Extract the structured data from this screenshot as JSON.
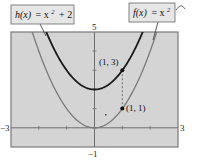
{
  "chart_data": {
    "type": "line",
    "title": "",
    "xlabel": "",
    "ylabel": "",
    "xlim": [
      -3,
      3
    ],
    "ylim": [
      -1,
      5
    ],
    "grid": false,
    "tick_labels": {
      "x_min": "−3",
      "x_max": "3",
      "y_min": "−1",
      "y_max": "5"
    },
    "series": [
      {
        "name": "h(x) = x² + 2",
        "function": "x^2 + 2",
        "color": "#1a1a1a",
        "x": [
          -1.732,
          -1.5,
          -1,
          -0.5,
          0,
          0.5,
          1,
          1.5,
          1.732
        ],
        "values": [
          5,
          4.25,
          3,
          2.25,
          2,
          2.25,
          3,
          4.25,
          5
        ]
      },
      {
        "name": "f(x) = x²",
        "function": "x^2",
        "color": "#7a7a7a",
        "x": [
          -2.236,
          -2,
          -1.5,
          -1,
          -0.5,
          0,
          0.5,
          1,
          1.5,
          2,
          2.236
        ],
        "values": [
          5,
          4,
          2.25,
          1,
          0.25,
          0,
          0.25,
          1,
          2.25,
          4,
          5
        ]
      }
    ],
    "annotations": [
      {
        "text": "(1, 3)",
        "x": 1,
        "y": 3
      },
      {
        "text": "(1, 1)",
        "x": 1,
        "y": 1
      }
    ],
    "legend": {
      "h_label": {
        "fn": "h(x)",
        "eq": "= x",
        "exp": "2",
        "rest": "+ 2"
      },
      "f_label": {
        "fn": "f(x)",
        "eq": "= x",
        "exp": "2"
      }
    },
    "colors": {
      "plot_background": "#d4d4d4",
      "label_box": "#e6e6e6",
      "axis": "#6e6e6e",
      "frame": "#7a7a7a"
    }
  }
}
